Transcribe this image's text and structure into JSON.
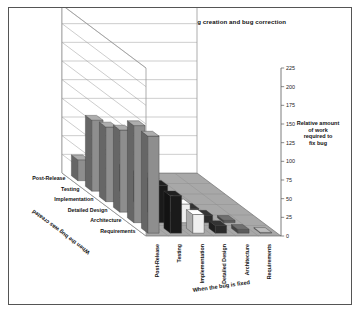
{
  "figure": {
    "title": "The increase in cost due to a delay in bug creation and bug correction",
    "frame_border_color": "#555555",
    "background_color": "#ffffff"
  },
  "axes": {
    "value_axis": {
      "title_line1": "Relative amount",
      "title_line2": "of work",
      "title_line3": "required to",
      "title_line4": "fix bug",
      "ticks": [
        "0",
        "25",
        "50",
        "75",
        "100",
        "125",
        "150",
        "175",
        "200",
        "225"
      ],
      "min": 0,
      "max": 225
    },
    "depth_axis": {
      "title": "When the bug was created",
      "categories": [
        "Requirements",
        "Architecture",
        "Detailed Design",
        "Implementation",
        "Testing",
        "Post-Release"
      ]
    },
    "series_axis": {
      "title": "When the bug is fixed",
      "categories": [
        "Requirements",
        "Architecture",
        "Detailed Design",
        "Implementation",
        "Testing",
        "Post-Release"
      ]
    }
  },
  "palette": {
    "floor": "#a8a8a8",
    "floor_edge": "#6f6f6f",
    "wall": "#ffffff",
    "wall_edge": "#8a8a8a",
    "gridline": "#9a9a9a",
    "bar_colors": [
      "#9b9b9b",
      "#5c5c5c",
      "#2a2a2a",
      "#efefef",
      "#1a1a1a",
      "#8e8e8e"
    ]
  },
  "footnote": "",
  "chart_data": {
    "type": "bar",
    "title": "The increase in cost due to a delay in bug creation and bug correction",
    "xlabel": "When the bug is fixed",
    "ylabel": "Relative amount of work required to fix bug",
    "zlabel": "When the bug was created",
    "ylim": [
      0,
      225
    ],
    "grid": true,
    "legend": "none",
    "categories": [
      "Requirements",
      "Architecture",
      "Detailed Design",
      "Implementation",
      "Testing",
      "Post-Release"
    ],
    "rows": [
      "Requirements",
      "Architecture",
      "Detailed Design",
      "Implementation",
      "Testing",
      "Post-Release"
    ],
    "series": [
      {
        "name": "Requirements",
        "values": [
          1,
          5,
          10,
          25,
          50,
          130
        ]
      },
      {
        "name": "Architecture",
        "values": [
          0,
          3,
          10,
          25,
          50,
          130
        ]
      },
      {
        "name": "Detailed Design",
        "values": [
          0,
          0,
          5,
          20,
          40,
          110
        ]
      },
      {
        "name": "Implementation",
        "values": [
          0,
          0,
          0,
          15,
          35,
          100
        ]
      },
      {
        "name": "Testing",
        "values": [
          0,
          0,
          0,
          0,
          30,
          95
        ]
      },
      {
        "name": "Post-Release",
        "values": [
          0,
          0,
          0,
          0,
          0,
          28
        ]
      }
    ],
    "note": "Lower-triangle combinations (bug fixed before it was created) have no bar."
  }
}
